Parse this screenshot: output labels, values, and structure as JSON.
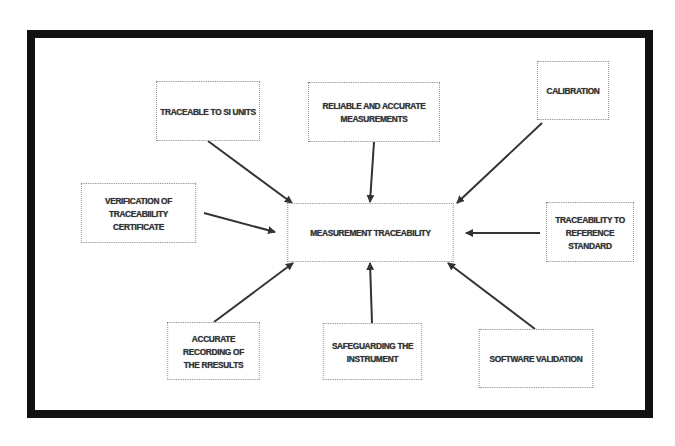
{
  "diagram": {
    "center": {
      "label": "MEASUREMENT TRACEABILITY"
    },
    "nodes": [
      {
        "id": "si-units",
        "label": "TRACEABLE TO SI UNITS"
      },
      {
        "id": "reliable",
        "label": "RELIABLE AND ACCURATE\nMEASUREMENTS"
      },
      {
        "id": "calibration",
        "label": "CALIBRATION"
      },
      {
        "id": "verification",
        "label": "VERIFICATION OF\nTRACEABIILITY\nCERTIFICATE"
      },
      {
        "id": "reference",
        "label": "TRACEABILITY TO\nREFERENCE\nSTANDARD"
      },
      {
        "id": "recording",
        "label": "ACCURATE\nRECORDING OF\nTHE RRESULTS"
      },
      {
        "id": "safeguarding",
        "label": "SAFEGUARDING THE\nINSTRUMENT"
      },
      {
        "id": "software",
        "label": "SOFTWARE VALIDATION"
      }
    ],
    "edges": [
      {
        "from": "si-units",
        "to": "center"
      },
      {
        "from": "reliable",
        "to": "center"
      },
      {
        "from": "calibration",
        "to": "center"
      },
      {
        "from": "verification",
        "to": "center"
      },
      {
        "from": "reference",
        "to": "center"
      },
      {
        "from": "recording",
        "to": "center"
      },
      {
        "from": "safeguarding",
        "to": "center"
      },
      {
        "from": "software",
        "to": "center"
      }
    ],
    "colors": {
      "frame": "#111111",
      "arrow": "#333333",
      "box_border": "#8a8a8a",
      "text": "#333333"
    }
  }
}
